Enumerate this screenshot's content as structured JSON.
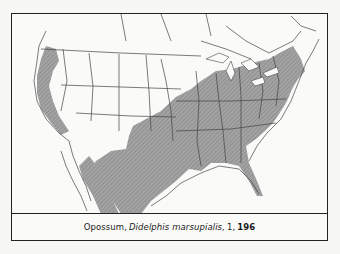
{
  "map": {
    "title": "Opossum range map",
    "shaded_region": "Range of Opossum (Didelphis marsupialis) in North America",
    "colors": {
      "shaded": "#9a9a9a",
      "land": "#fafaf8",
      "border": "#222222",
      "lines": "#444444"
    }
  },
  "caption": {
    "common_name": "Opossum,",
    "scientific_name": "Didelphis marsupialis,",
    "volume": "1,",
    "page": "196"
  }
}
